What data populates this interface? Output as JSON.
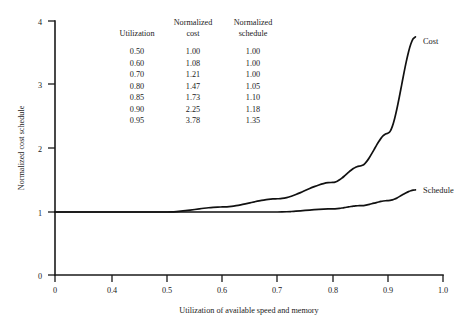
{
  "chart_data": {
    "type": "line",
    "title": "",
    "xlabel": "Utilization of available speed and memory",
    "ylabel": "Normalized cost schedule",
    "xlim": [
      0,
      1.0
    ],
    "ylim": [
      0,
      4
    ],
    "grid": false,
    "legend_position": "inline-right-end",
    "x_broken_axis": true,
    "xticks": [
      "0",
      "0.4",
      "0.5",
      "0.6",
      "0.7",
      "0.8",
      "0.9",
      "1.0"
    ],
    "xtick_values": [
      0,
      0.4,
      0.5,
      0.6,
      0.7,
      0.8,
      0.9,
      1.0
    ],
    "yticks": [
      "0",
      "1",
      "2",
      "3",
      "4"
    ],
    "ytick_values": [
      0,
      1,
      2,
      3,
      4
    ],
    "x": [
      0.0,
      0.4,
      0.5,
      0.6,
      0.7,
      0.8,
      0.85,
      0.9,
      0.95
    ],
    "series": [
      {
        "name": "Cost",
        "label": "Cost",
        "values": [
          1.0,
          1.0,
          1.0,
          1.08,
          1.21,
          1.47,
          1.73,
          2.25,
          3.78
        ]
      },
      {
        "name": "Schedule",
        "label": "Schedule",
        "values": [
          1.0,
          1.0,
          1.0,
          1.0,
          1.0,
          1.05,
          1.1,
          1.18,
          1.35
        ]
      }
    ]
  },
  "table": {
    "headers": [
      {
        "line1": "",
        "line2": "Utilization"
      },
      {
        "line1": "Normalized",
        "line2": "cost"
      },
      {
        "line1": "Normalized",
        "line2": "schedule"
      }
    ],
    "rows": [
      {
        "utilization": "0.50",
        "cost": "1.00",
        "schedule": "1.00"
      },
      {
        "utilization": "0.60",
        "cost": "1.08",
        "schedule": "1.00"
      },
      {
        "utilization": "0.70",
        "cost": "1.21",
        "schedule": "1.00"
      },
      {
        "utilization": "0.80",
        "cost": "1.47",
        "schedule": "1.05"
      },
      {
        "utilization": "0.85",
        "cost": "1.73",
        "schedule": "1.10"
      },
      {
        "utilization": "0.90",
        "cost": "2.25",
        "schedule": "1.18"
      },
      {
        "utilization": "0.95",
        "cost": "3.78",
        "schedule": "1.35"
      }
    ]
  },
  "colors": {
    "curve": "#111111",
    "axis": "#1a1a1a",
    "text": "#1a1a1a",
    "background": "#ffffff"
  }
}
